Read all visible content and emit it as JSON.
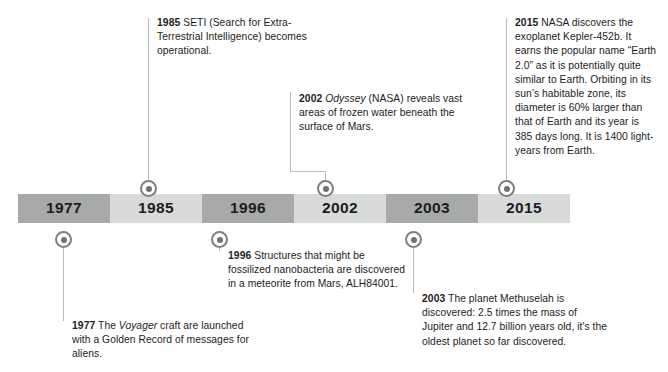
{
  "timeline": {
    "segments": [
      {
        "year": "1977",
        "tone": "dark"
      },
      {
        "year": "1985",
        "tone": "light"
      },
      {
        "year": "1996",
        "tone": "dark"
      },
      {
        "year": "2002",
        "tone": "light"
      },
      {
        "year": "2003",
        "tone": "dark"
      },
      {
        "year": "2015",
        "tone": "light"
      }
    ],
    "colors": {
      "segment_dark": "#a8aaaa",
      "segment_light": "#d9dada",
      "marker_ring": "#7d7f82",
      "marker_core": "#6f7174",
      "leader_line": "#b9bbbd",
      "text": "#1c1c22"
    }
  },
  "callouts": [
    {
      "id": "1977",
      "year": "1977",
      "position": "below",
      "text_before": " The ",
      "italic": "Voyager",
      "text_after": " craft are launched with a Golden Record of messages for aliens.",
      "full_text": "1977 The Voyager craft are launched with a Golden Record of messages for aliens."
    },
    {
      "id": "1985",
      "year": "1985",
      "position": "above",
      "text_before": " SETI (Search for Extra-Terrestrial Intelligence) becomes operational.",
      "italic": "",
      "text_after": "",
      "full_text": "1985 SETI (Search for Extra-Terrestrial Intelligence) becomes operational."
    },
    {
      "id": "1996",
      "year": "1996",
      "position": "below",
      "text_before": " Structures that might be fossilized nanobacteria are discovered in a meteorite from Mars, ALH84001.",
      "italic": "",
      "text_after": "",
      "full_text": "1996 Structures that might be fossilized nanobacteria are discovered in a meteorite from Mars, ALH84001."
    },
    {
      "id": "2002",
      "year": "2002",
      "position": "above",
      "text_before": " ",
      "italic": "Odyssey",
      "text_after": " (NASA) reveals vast areas of frozen water beneath the surface of Mars.",
      "full_text": "2002 Odyssey (NASA) reveals vast areas of frozen water beneath the surface of Mars."
    },
    {
      "id": "2003",
      "year": "2003",
      "position": "below",
      "text_before": " The planet Methuselah is discovered: 2.5 times the mass of Jupiter and 12.7 billion years old, it's the oldest planet so far discovered.",
      "italic": "",
      "text_after": "",
      "full_text": "2003 The planet Methuselah is discovered: 2.5 times the mass of Jupiter and 12.7 billion years old, it's the oldest planet so far discovered."
    },
    {
      "id": "2015",
      "year": "2015",
      "position": "above",
      "text_before": " NASA discovers the exoplanet Kepler-452b. It earns the popular name “Earth 2.0” as it is potentially quite similar to Earth. Orbiting in its sun’s habitable zone, its diameter is 60% larger than that of Earth and its year is 385 days long. It is 1400 light-years from Earth.",
      "italic": "",
      "text_after": "",
      "full_text": "2015 NASA discovers the exoplanet Kepler-452b. It earns the popular name “Earth 2.0” as it is potentially quite similar to Earth. Orbiting in its sun’s habitable zone, its diameter is 60% larger than that of Earth and its year is 385 days long. It is 1400 light-years from Earth."
    }
  ]
}
